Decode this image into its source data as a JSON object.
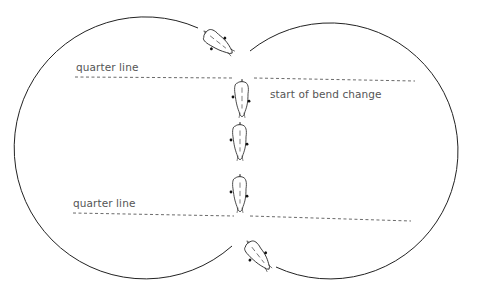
{
  "diagram": {
    "type": "riding-figure",
    "labels": {
      "quarter_line_top": "quarter line",
      "bend_change": "start of bend change",
      "quarter_line_bottom": "quarter line"
    },
    "colors": {
      "stroke": "#222222",
      "dash": "#444444",
      "text": "#555555",
      "background": "#ffffff"
    },
    "horses": [
      {
        "id": 1,
        "position": "top diagonal",
        "rotation": 40
      },
      {
        "id": 2,
        "position": "centerline below top quarter line",
        "rotation": 0
      },
      {
        "id": 3,
        "position": "centerline middle",
        "rotation": 0
      },
      {
        "id": 4,
        "position": "centerline above bottom quarter line",
        "rotation": 0
      },
      {
        "id": 5,
        "position": "bottom diagonal",
        "rotation": -40
      }
    ]
  }
}
